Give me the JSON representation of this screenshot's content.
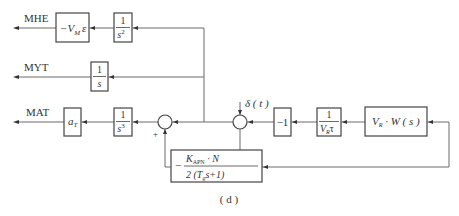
{
  "diagram": {
    "caption": "( d )",
    "outputs": {
      "mhe": "MHE",
      "myt": "MYT",
      "mat": "MAT"
    },
    "input": {
      "disturbance": "δ ( t )"
    },
    "blocks": {
      "vm_eps": {
        "prefix": "−V",
        "sub": "M",
        "suffix": "ε"
      },
      "int2": {
        "num": "1",
        "den": "s",
        "exp": "2"
      },
      "int1": {
        "num": "1",
        "den": "s"
      },
      "at": {
        "main": "a",
        "sub": "T"
      },
      "int3": {
        "num": "1",
        "den": "s",
        "exp": "3"
      },
      "neg1": {
        "text": "−1"
      },
      "inv_vr_tau": {
        "num": "1",
        "den_main": "V",
        "den_sub": "R",
        "den_tail": "τ"
      },
      "vr_w": {
        "main": "V",
        "sub": "R",
        "tail": " · W ( s )"
      },
      "feedback": {
        "sign": "−",
        "num_main": "K",
        "num_sub": "APN",
        "num_tail": " · N",
        "den_head": "2 (T",
        "den_sub": "g",
        "den_tail": "s+1)"
      }
    },
    "summers": {
      "sum1_sign": "+"
    }
  }
}
